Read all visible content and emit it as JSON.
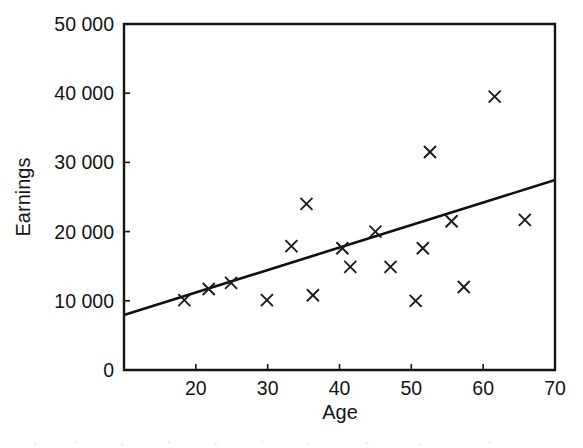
{
  "figure": {
    "background_color": "#ffffff",
    "ink_color": "#141414"
  },
  "chart_data": {
    "type": "scatter",
    "title": "",
    "xlabel": "Age",
    "ylabel": "Earnings",
    "xlim": [
      10,
      70
    ],
    "ylim": [
      0,
      50000
    ],
    "grid": false,
    "legend": null,
    "x_ticks": [
      20,
      30,
      40,
      50,
      60,
      70
    ],
    "x_tick_labels": [
      "20",
      "30",
      "40",
      "50",
      "60",
      "70"
    ],
    "y_ticks": [
      0,
      10000,
      20000,
      30000,
      40000,
      50000
    ],
    "y_tick_labels": [
      "0",
      "10 000",
      "20 000",
      "30 000",
      "40 000",
      "50 000"
    ],
    "marker": "x",
    "points": [
      {
        "x": 18.4,
        "y": 10100
      },
      {
        "x": 21.8,
        "y": 11700
      },
      {
        "x": 24.9,
        "y": 12600
      },
      {
        "x": 29.9,
        "y": 10100
      },
      {
        "x": 33.3,
        "y": 17900
      },
      {
        "x": 35.4,
        "y": 24000
      },
      {
        "x": 36.3,
        "y": 10800
      },
      {
        "x": 40.4,
        "y": 17600
      },
      {
        "x": 41.5,
        "y": 14900
      },
      {
        "x": 45.0,
        "y": 20000
      },
      {
        "x": 47.1,
        "y": 14900
      },
      {
        "x": 50.6,
        "y": 10000
      },
      {
        "x": 51.6,
        "y": 17600
      },
      {
        "x": 52.6,
        "y": 31500
      },
      {
        "x": 55.6,
        "y": 21500
      },
      {
        "x": 57.3,
        "y": 12000
      },
      {
        "x": 61.6,
        "y": 39500
      },
      {
        "x": 65.8,
        "y": 21700
      }
    ],
    "trendline": {
      "kind": "linear-fit",
      "x_start": 10,
      "y_start": 7950,
      "x_end": 70,
      "y_end": 27450
    }
  }
}
